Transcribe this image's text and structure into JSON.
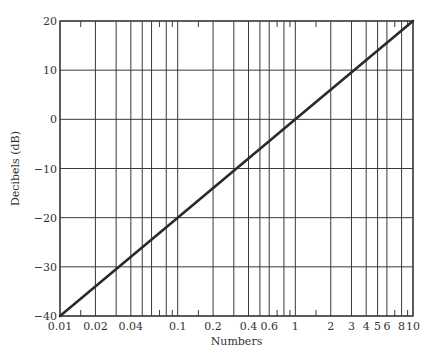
{
  "chart_data": {
    "type": "line",
    "title": "",
    "xlabel": "Numbers",
    "ylabel": "Decibels (dB)",
    "xscale": "log",
    "xlim": [
      0.01,
      10
    ],
    "ylim": [
      -40,
      20
    ],
    "grid": true,
    "legend": null,
    "x_tick_labels": [
      {
        "value": 0.01,
        "label": "0.01"
      },
      {
        "value": 0.02,
        "label": "0.02"
      },
      {
        "value": 0.04,
        "label": "0.04"
      },
      {
        "value": 0.1,
        "label": "0.1"
      },
      {
        "value": 0.2,
        "label": "0.2"
      },
      {
        "value": 0.4,
        "label": "0.4"
      },
      {
        "value": 0.6,
        "label": "0.6"
      },
      {
        "value": 1,
        "label": "1"
      },
      {
        "value": 2,
        "label": "2"
      },
      {
        "value": 3,
        "label": "3"
      },
      {
        "value": 4,
        "label": "4"
      },
      {
        "value": 5,
        "label": "5"
      },
      {
        "value": 6,
        "label": "6"
      },
      {
        "value": 8,
        "label": "8"
      },
      {
        "value": 10,
        "label": "10"
      }
    ],
    "y_tick_labels": [
      {
        "value": 20,
        "label": "20"
      },
      {
        "value": 10,
        "label": "10"
      },
      {
        "value": 0,
        "label": "0"
      },
      {
        "value": -10,
        "label": "−10"
      },
      {
        "value": -20,
        "label": "−20"
      },
      {
        "value": -30,
        "label": "−30"
      },
      {
        "value": -40,
        "label": "−40"
      }
    ],
    "x_gridlines": [
      0.01,
      0.02,
      0.03,
      0.04,
      0.05,
      0.06,
      0.08,
      0.1,
      0.2,
      0.3,
      0.4,
      0.5,
      0.6,
      0.8,
      1,
      2,
      3,
      4,
      5,
      6,
      8,
      10
    ],
    "x_minor_ticks": [
      0.015,
      0.07,
      0.09,
      0.15,
      0.7,
      0.9,
      1.5,
      7,
      9
    ],
    "y_gridlines": [
      20,
      10,
      0,
      -10,
      -20,
      -30,
      -40
    ],
    "series": [
      {
        "name": "dB = 20 log10(N)",
        "x": [
          0.01,
          0.1,
          1,
          10
        ],
        "y": [
          -40,
          -20,
          0,
          20
        ]
      }
    ]
  },
  "layout": {
    "plot_left": 60,
    "plot_right": 413,
    "plot_top": 21,
    "plot_bottom": 316,
    "line_color": "#2a2a2a",
    "grid_color": "#3a3a3a"
  }
}
